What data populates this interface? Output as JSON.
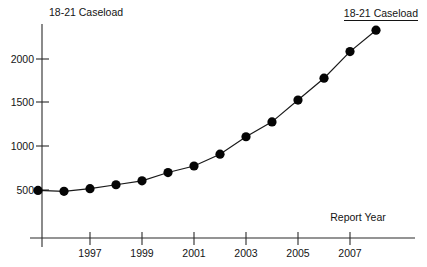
{
  "chart_data": {
    "type": "line",
    "title": "",
    "subtitle": "",
    "xlabel": "Report Year",
    "ylabel": "18-21 Caseload",
    "legend": [
      "18-21 Caseload"
    ],
    "legend_position": "top-right",
    "grid": false,
    "x": [
      1995,
      1996,
      1997,
      1998,
      1999,
      2000,
      2001,
      2002,
      2003,
      2004,
      2005,
      2006,
      2007,
      2008
    ],
    "values": [
      495,
      485,
      515,
      560,
      605,
      700,
      775,
      910,
      1110,
      1280,
      1530,
      1780,
      2085,
      2330
    ],
    "categories": [
      "1995",
      "1996",
      "1997",
      "1998",
      "1999",
      "2000",
      "2001",
      "2002",
      "2003",
      "2004",
      "2005",
      "2006",
      "2007",
      "2008"
    ],
    "series": [
      {
        "name": "18-21 Caseload",
        "values": [
          495,
          485,
          515,
          560,
          605,
          700,
          775,
          910,
          1110,
          1280,
          1530,
          1780,
          2085,
          2330
        ]
      }
    ],
    "xlim": [
      1995,
      2008.3
    ],
    "ylim": [
      0,
      2450
    ],
    "xticks": [
      1997,
      1999,
      2001,
      2003,
      2005,
      2007
    ],
    "xtick_labels": [
      "1997",
      "1999",
      "2001",
      "2003",
      "2005",
      "2007"
    ],
    "yticks": [
      500,
      1000,
      1500,
      2000
    ],
    "ytick_labels": [
      "500",
      "1000",
      "1500",
      "2000"
    ],
    "marker": "filled-circle",
    "line_color": "#1a1a1a",
    "marker_color": "#050505"
  },
  "labels": {
    "y_axis_title": "18-21 Caseload",
    "x_axis_title": "Report Year",
    "legend_label": "18-21 Caseload",
    "ytick_0": "500",
    "ytick_1": "1000",
    "ytick_2": "1500",
    "ytick_3": "2000",
    "xtick_0": "1997",
    "xtick_1": "1999",
    "xtick_2": "2001",
    "xtick_3": "2003",
    "xtick_4": "2005",
    "xtick_5": "2007"
  }
}
